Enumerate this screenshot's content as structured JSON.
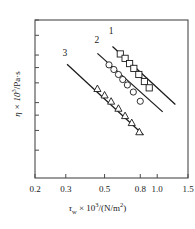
{
  "chart_data": {
    "type": "line",
    "title": "",
    "xlabel": "τw × 10³/(N/m²)",
    "ylabel": "η × 10³/Pa·s",
    "xscale": "log",
    "yscale": "log",
    "grid": false,
    "legend_position": "inline-curve-labels",
    "xlim": [
      0.2,
      1.5
    ],
    "ylim": [
      1.0,
      10.0
    ],
    "xticks": [
      0.2,
      0.3,
      0.5,
      0.8,
      1.0,
      1.5
    ],
    "xticklabels": [
      "0.2",
      "0.3",
      "0.5",
      "0.8",
      "1.0",
      "1.5"
    ],
    "yticks": [
      1.5,
      2,
      2.5,
      3,
      4,
      5,
      6,
      8,
      10
    ],
    "yticklabels": [
      "",
      "",
      "",
      "",
      "",
      "",
      "",
      "",
      ""
    ],
    "series": [
      {
        "name": "1",
        "marker": "square",
        "label": "1",
        "x": [
          0.615,
          0.655,
          0.695,
          0.735,
          0.785,
          0.845,
          0.9
        ],
        "y": [
          6.1,
          5.72,
          5.3,
          4.94,
          4.52,
          4.08,
          3.72
        ],
        "fit_x": [
          0.555,
          1.27
        ],
        "fit_y": [
          6.8,
          2.92
        ]
      },
      {
        "name": "2",
        "marker": "circle",
        "label": "2",
        "x": [
          0.53,
          0.565,
          0.6,
          0.635,
          0.675,
          0.73,
          0.8
        ],
        "y": [
          5.2,
          4.86,
          4.52,
          4.2,
          3.88,
          3.5,
          3.06
        ],
        "fit_x": [
          0.455,
          1.075
        ],
        "fit_y": [
          6.15,
          2.62
        ]
      },
      {
        "name": "3",
        "marker": "triangle",
        "label": "3",
        "x": [
          0.455,
          0.5,
          0.545,
          0.6,
          0.655,
          0.715,
          0.79
        ],
        "y": [
          3.68,
          3.35,
          3.06,
          2.76,
          2.48,
          2.24,
          1.96
        ],
        "fit_x": [
          0.305,
          0.835
        ],
        "fit_y": [
          5.25,
          1.87
        ]
      }
    ],
    "curve_labels": [
      {
        "text": "1",
        "x": 0.545,
        "y": 8.1
      },
      {
        "text": "2",
        "x": 0.452,
        "y": 7.15
      },
      {
        "text": "3",
        "x": 0.296,
        "y": 5.9
      }
    ],
    "axis_color": "#4a4a4a",
    "line_color": "#1a1a1a",
    "marker_color": "#1a1a1a"
  },
  "labels": {
    "x_axis_pre": "τ",
    "x_axis_sub": "w",
    "x_axis_mid": " × 10",
    "x_axis_exp": "3",
    "x_axis_post": "/(N/m",
    "x_axis_exp2": "2",
    "x_axis_end": ")",
    "y_axis_pre": "η × 10",
    "y_axis_exp": "3",
    "y_axis_post": "/Pa·s"
  }
}
